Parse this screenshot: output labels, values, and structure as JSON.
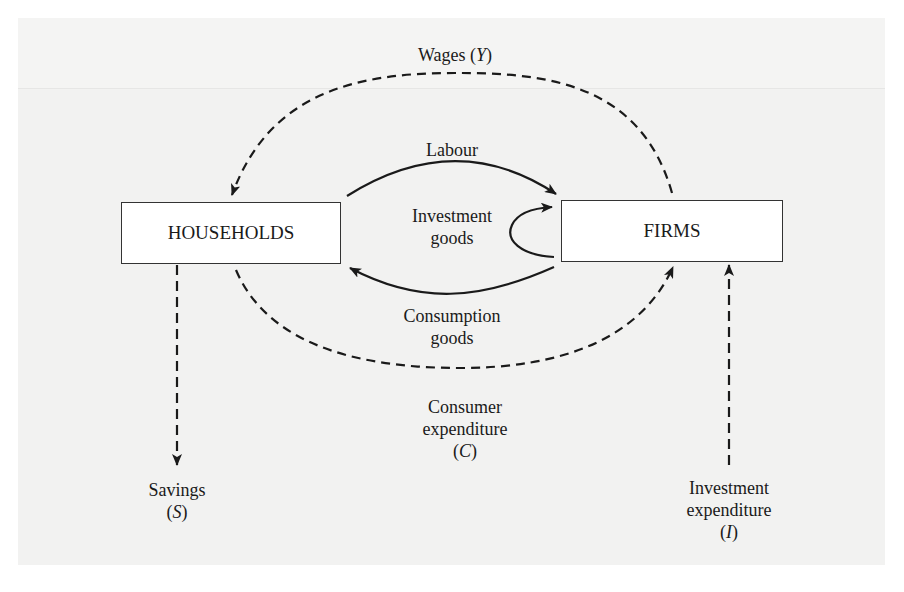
{
  "diagram": {
    "nodes": {
      "households": "HOUSEHOLDS",
      "firms": "FIRMS"
    },
    "labels": {
      "wages": {
        "text": "Wages (",
        "var": "Y",
        "close": ")"
      },
      "labour": "Labour",
      "investment_goods_line1": "Investment",
      "investment_goods_line2": "goods",
      "consumption_goods_line1": "Consumption",
      "consumption_goods_line2": "goods",
      "consumer_expenditure_line1": "Consumer",
      "consumer_expenditure_line2": "expenditure",
      "consumer_expenditure_var": "C",
      "savings_line1": "Savings",
      "savings_var": "S",
      "investment_expenditure_line1": "Investment",
      "investment_expenditure_line2": "expenditure",
      "investment_expenditure_var": "I"
    },
    "flows": [
      {
        "from": "firms",
        "to": "households",
        "label": "Wages (Y)",
        "style": "dashed"
      },
      {
        "from": "households",
        "to": "firms",
        "label": "Labour",
        "style": "solid"
      },
      {
        "from": "firms",
        "to": "firms",
        "label": "Investment goods",
        "style": "solid"
      },
      {
        "from": "firms",
        "to": "households",
        "label": "Consumption goods",
        "style": "solid"
      },
      {
        "from": "households",
        "to": "firms",
        "label": "Consumer expenditure (C)",
        "style": "dashed"
      },
      {
        "from": "households",
        "to": "savings",
        "label": "Savings (S)",
        "style": "dashed"
      },
      {
        "from": "investment",
        "to": "firms",
        "label": "Investment expenditure (I)",
        "style": "dashed"
      }
    ],
    "colors": {
      "background": "#f2f2f1",
      "line": "#1a1a1a",
      "box": "#ffffff"
    }
  }
}
